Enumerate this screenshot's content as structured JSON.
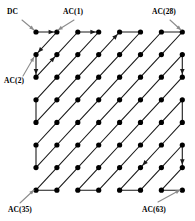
{
  "figure": {
    "name": "jpeg-zigzag-scan-order",
    "grid": {
      "rows": 8,
      "cols": 8,
      "origin_x": 36,
      "origin_y": 32,
      "step_x": 20.9,
      "step_y": 22.6,
      "node_radius": 2.6,
      "node_color": "#000000",
      "line_color": "#1a1a1a",
      "line_width": 1.1,
      "background": "#ffffff"
    },
    "labels": [
      {
        "id": "dc",
        "text": "DC",
        "x": 7,
        "y": 7,
        "arrow_from": [
          22,
          20
        ],
        "arrow_to": [
          34,
          30
        ]
      },
      {
        "id": "ac1",
        "text": "AC(1)",
        "x": 63,
        "y": 7,
        "arrow_from": [
          74,
          20
        ],
        "arrow_to": [
          58,
          30
        ]
      },
      {
        "id": "ac28",
        "text": "AC(28)",
        "x": 152,
        "y": 7,
        "arrow_from": [
          170,
          20
        ],
        "arrow_to": [
          181,
          30
        ]
      },
      {
        "id": "ac2",
        "text": "AC(2)",
        "x": 4,
        "y": 76,
        "arrow_from": [
          23,
          76
        ],
        "arrow_to": [
          34,
          57
        ]
      },
      {
        "id": "ac35",
        "text": "AC(35)",
        "x": 8,
        "y": 205,
        "arrow_from": [
          20,
          203
        ],
        "arrow_to": [
          34,
          190
        ]
      },
      {
        "id": "ac63",
        "text": "AC(63)",
        "x": 142,
        "y": 205,
        "arrow_from": [
          158,
          202
        ],
        "arrow_to": [
          180,
          190
        ]
      }
    ],
    "scan_order": [
      [
        0,
        0
      ],
      [
        0,
        1
      ],
      [
        1,
        0
      ],
      [
        2,
        0
      ],
      [
        1,
        1
      ],
      [
        0,
        2
      ],
      [
        0,
        3
      ],
      [
        1,
        2
      ],
      [
        2,
        1
      ],
      [
        3,
        0
      ],
      [
        4,
        0
      ],
      [
        3,
        1
      ],
      [
        2,
        2
      ],
      [
        1,
        3
      ],
      [
        0,
        4
      ],
      [
        0,
        5
      ],
      [
        1,
        4
      ],
      [
        2,
        3
      ],
      [
        3,
        2
      ],
      [
        4,
        1
      ],
      [
        5,
        0
      ],
      [
        6,
        0
      ],
      [
        5,
        1
      ],
      [
        4,
        2
      ],
      [
        3,
        3
      ],
      [
        2,
        4
      ],
      [
        1,
        5
      ],
      [
        0,
        6
      ],
      [
        0,
        7
      ],
      [
        1,
        6
      ],
      [
        2,
        5
      ],
      [
        3,
        4
      ],
      [
        4,
        3
      ],
      [
        5,
        2
      ],
      [
        6,
        1
      ],
      [
        7,
        0
      ],
      [
        7,
        1
      ],
      [
        6,
        2
      ],
      [
        5,
        3
      ],
      [
        4,
        4
      ],
      [
        3,
        5
      ],
      [
        2,
        6
      ],
      [
        1,
        7
      ],
      [
        2,
        7
      ],
      [
        3,
        6
      ],
      [
        4,
        5
      ],
      [
        5,
        4
      ],
      [
        6,
        3
      ],
      [
        7,
        2
      ],
      [
        7,
        3
      ],
      [
        6,
        4
      ],
      [
        5,
        5
      ],
      [
        4,
        6
      ],
      [
        3,
        7
      ],
      [
        4,
        7
      ],
      [
        5,
        6
      ],
      [
        6,
        5
      ],
      [
        7,
        4
      ],
      [
        7,
        5
      ],
      [
        6,
        6
      ],
      [
        5,
        7
      ],
      [
        6,
        7
      ],
      [
        7,
        6
      ],
      [
        7,
        7
      ]
    ],
    "coefficient_names": {
      "first": "DC",
      "second": "AC(1)",
      "third": "AC(2)",
      "top_right": "AC(28)",
      "bottom_left": "AC(35)",
      "last": "AC(63)"
    }
  }
}
